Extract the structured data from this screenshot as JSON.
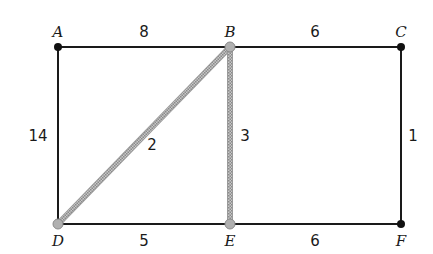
{
  "diagram": {
    "type": "weighted-graph",
    "vertices": [
      {
        "id": "A",
        "label": "A",
        "x": 58,
        "y": 47,
        "highlighted": false
      },
      {
        "id": "B",
        "label": "B",
        "x": 230,
        "y": 47,
        "highlighted": true
      },
      {
        "id": "C",
        "label": "C",
        "x": 401,
        "y": 47,
        "highlighted": false
      },
      {
        "id": "D",
        "label": "D",
        "x": 58,
        "y": 224,
        "highlighted": true
      },
      {
        "id": "E",
        "label": "E",
        "x": 230,
        "y": 224,
        "highlighted": true
      },
      {
        "id": "F",
        "label": "F",
        "x": 401,
        "y": 224,
        "highlighted": false
      }
    ],
    "edges": [
      {
        "from": "A",
        "to": "B",
        "weight": "8",
        "highlighted": false
      },
      {
        "from": "B",
        "to": "C",
        "weight": "6",
        "highlighted": false
      },
      {
        "from": "A",
        "to": "D",
        "weight": "14",
        "highlighted": false
      },
      {
        "from": "B",
        "to": "D",
        "weight": "2",
        "highlighted": true
      },
      {
        "from": "B",
        "to": "E",
        "weight": "3",
        "highlighted": true
      },
      {
        "from": "C",
        "to": "F",
        "weight": "1",
        "highlighted": false
      },
      {
        "from": "D",
        "to": "E",
        "weight": "5",
        "highlighted": false
      },
      {
        "from": "E",
        "to": "F",
        "weight": "6",
        "highlighted": false
      }
    ],
    "colors": {
      "edge": "#1a1a1a",
      "highlight_edge": "#a8a8a8",
      "vertex": "#111111"
    }
  }
}
